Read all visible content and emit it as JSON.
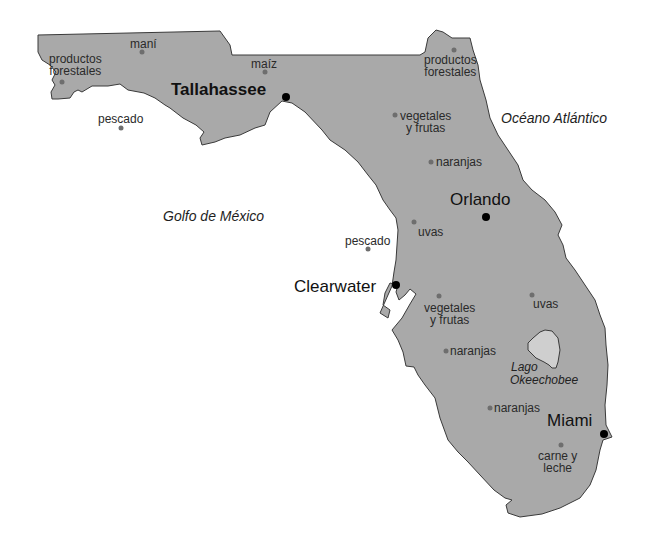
{
  "map": {
    "region": "Florida",
    "colors": {
      "land": "#a9a9a9",
      "lake": "#cfcfcf",
      "outline": "#3a3a3a",
      "product_marker": "#6e6e6e",
      "city_marker": "#000000",
      "water_background": "#ffffff"
    },
    "water_bodies": {
      "gulf": "Golfo de México",
      "atlantic": "Océano Atlántico",
      "lake": "Lago Okeechobee",
      "lake_line1": "Lago",
      "lake_line2": "Okeechobee"
    },
    "cities": [
      {
        "name": "Tallahassee",
        "capital": true
      },
      {
        "name": "Orlando",
        "capital": false
      },
      {
        "name": "Clearwater",
        "capital": false
      },
      {
        "name": "Miami",
        "capital": false
      }
    ],
    "products": [
      {
        "line1": "productos",
        "line2": "forestales",
        "location": "northwest panhandle"
      },
      {
        "line1": "maní",
        "line2": "",
        "location": "panhandle north"
      },
      {
        "line1": "maíz",
        "line2": "",
        "location": "near Tallahassee"
      },
      {
        "line1": "pescado",
        "line2": "",
        "location": "Gulf, off panhandle"
      },
      {
        "line1": "productos",
        "line2": "forestales",
        "location": "northeast"
      },
      {
        "line1": "vegetales",
        "line2": "y frutas",
        "location": "north central"
      },
      {
        "line1": "naranjas",
        "line2": "",
        "location": "north of Orlando"
      },
      {
        "line1": "uvas",
        "line2": "",
        "location": "west of Orlando"
      },
      {
        "line1": "pescado",
        "line2": "",
        "location": "Gulf, near Clearwater"
      },
      {
        "line1": "vegetales",
        "line2": "y frutas",
        "location": "south of Clearwater"
      },
      {
        "line1": "uvas",
        "line2": "",
        "location": "east central"
      },
      {
        "line1": "naranjas",
        "line2": "",
        "location": "southwest central"
      },
      {
        "line1": "naranjas",
        "line2": "",
        "location": "south"
      },
      {
        "line1": "carne y",
        "line2": "leche",
        "location": "south near Miami"
      }
    ]
  }
}
